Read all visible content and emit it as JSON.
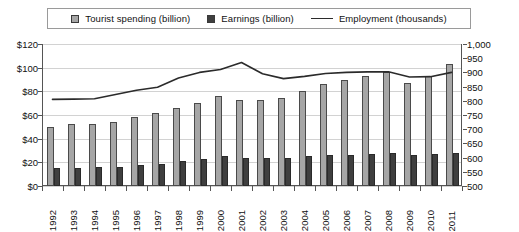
{
  "legend": {
    "position": "top",
    "items": [
      {
        "label": "Tourist spending (billion)",
        "marker": "square-light-gray",
        "color": "#a6a6a6"
      },
      {
        "label": "Earnings (billion)",
        "marker": "square-dark-gray",
        "color": "#3f3f3f"
      },
      {
        "label": "Employment (thousands)",
        "marker": "line",
        "color": "#2b2b2b"
      }
    ]
  },
  "axes": {
    "left_ticks": [
      "$120",
      "$100",
      "$80",
      "$60",
      "$40",
      "$20",
      "$0"
    ],
    "right_ticks": [
      "1,000",
      "950",
      "900",
      "850",
      "800",
      "750",
      "700",
      "650",
      "600",
      "550",
      "500"
    ]
  },
  "chart_data": {
    "type": "bar",
    "title": "",
    "subtitle": "",
    "xlabel": "",
    "ylabel": "",
    "y2label": "",
    "grid": true,
    "legend_position": "top",
    "categories": [
      "1992",
      "1993",
      "1994",
      "1995",
      "1996",
      "1997",
      "1998",
      "1999",
      "2000",
      "2001",
      "2002",
      "2003",
      "2004",
      "2005",
      "2006",
      "2007",
      "2008",
      "2009",
      "2010",
      "2011"
    ],
    "ylim": [
      0,
      120
    ],
    "y2lim": [
      500,
      1000
    ],
    "series": [
      {
        "name": "Tourist spending (billion)",
        "type": "bar",
        "axis": "left",
        "color": "#a6a6a6",
        "values": [
          50,
          52,
          52,
          54,
          58,
          62,
          66,
          70,
          76,
          73,
          73,
          74,
          80,
          86,
          90,
          93,
          96,
          87,
          93,
          103
        ]
      },
      {
        "name": "Earnings (billion)",
        "type": "bar",
        "axis": "left",
        "color": "#3f3f3f",
        "values": [
          15,
          15,
          16,
          16,
          18,
          19,
          21,
          23,
          25,
          24,
          24,
          24,
          25,
          26,
          26,
          27,
          28,
          26,
          27,
          28
        ]
      },
      {
        "name": "Employment (thousands)",
        "type": "line",
        "axis": "right",
        "color": "#2b2b2b",
        "values": [
          805,
          806,
          807,
          822,
          837,
          848,
          880,
          900,
          910,
          935,
          895,
          878,
          886,
          896,
          900,
          902,
          902,
          884,
          885,
          900
        ]
      }
    ]
  }
}
